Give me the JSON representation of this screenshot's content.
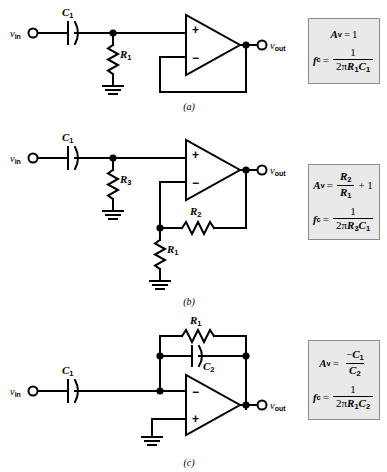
{
  "figure": {
    "type": "circuit-schematic-set",
    "background": "#ffffff",
    "ink_color": "#000000",
    "box_fill": "#e9e9e9",
    "box_border": "#8a8a8a"
  },
  "circuits": [
    {
      "id": "a",
      "caption": "(a)",
      "name": "unity-gain-high-pass-filter",
      "input_label": "v",
      "input_sub": "in",
      "output_label": "v",
      "output_sub": "out",
      "components": [
        {
          "ref": "C",
          "sub": "1",
          "kind": "capacitor",
          "orientation": "horizontal"
        },
        {
          "ref": "R",
          "sub": "1",
          "kind": "resistor",
          "orientation": "vertical"
        }
      ],
      "opamp": {
        "plus": "+",
        "minus": "−",
        "plus_position": "top",
        "minus_position": "bottom"
      },
      "formula": {
        "gain": {
          "lhs_main": "A",
          "lhs_sub": "v",
          "eq": "=",
          "rhs": "1"
        },
        "cutoff": {
          "lhs_main": "f",
          "lhs_sub": "c",
          "eq": "=",
          "numerator": "1",
          "denominator_prefix": "2π",
          "denominator_terms": [
            {
              "main": "R",
              "sub": "1"
            },
            {
              "main": "C",
              "sub": "1"
            }
          ]
        }
      }
    },
    {
      "id": "b",
      "caption": "(b)",
      "name": "non-inverting-gain-high-pass-filter",
      "input_label": "v",
      "input_sub": "in",
      "output_label": "v",
      "output_sub": "out",
      "components": [
        {
          "ref": "C",
          "sub": "1",
          "kind": "capacitor",
          "orientation": "horizontal"
        },
        {
          "ref": "R",
          "sub": "3",
          "kind": "resistor",
          "orientation": "vertical"
        },
        {
          "ref": "R",
          "sub": "2",
          "kind": "resistor",
          "orientation": "horizontal"
        },
        {
          "ref": "R",
          "sub": "1",
          "kind": "resistor",
          "orientation": "vertical"
        }
      ],
      "opamp": {
        "plus": "+",
        "minus": "−",
        "plus_position": "top",
        "minus_position": "bottom"
      },
      "formula": {
        "gain": {
          "lhs_main": "A",
          "lhs_sub": "v",
          "eq": "=",
          "numerator_main": "R",
          "numerator_sub": "2",
          "denominator_main": "R",
          "denominator_sub": "1",
          "trailing": "+ 1"
        },
        "cutoff": {
          "lhs_main": "f",
          "lhs_sub": "c",
          "eq": "=",
          "numerator": "1",
          "denominator_prefix": "2π",
          "denominator_terms": [
            {
              "main": "R",
              "sub": "3"
            },
            {
              "main": "C",
              "sub": "1"
            }
          ]
        }
      }
    },
    {
      "id": "c",
      "caption": "(c)",
      "name": "inverting-low-pass-filter",
      "input_label": "v",
      "input_sub": "in",
      "output_label": "v",
      "output_sub": "out",
      "components": [
        {
          "ref": "C",
          "sub": "1",
          "kind": "capacitor",
          "orientation": "horizontal"
        },
        {
          "ref": "R",
          "sub": "1",
          "kind": "resistor",
          "orientation": "horizontal"
        },
        {
          "ref": "C",
          "sub": "2",
          "kind": "capacitor",
          "orientation": "horizontal"
        }
      ],
      "opamp": {
        "plus": "+",
        "minus": "−",
        "plus_position": "bottom",
        "minus_position": "top"
      },
      "formula": {
        "gain": {
          "lhs_main": "A",
          "lhs_sub": "v",
          "eq": "=",
          "numerator_sign": "−",
          "numerator_main": "C",
          "numerator_sub": "1",
          "denominator_main": "C",
          "denominator_sub": "2"
        },
        "cutoff": {
          "lhs_main": "f",
          "lhs_sub": "c",
          "eq": "=",
          "numerator": "1",
          "denominator_prefix": "2π",
          "denominator_terms": [
            {
              "main": "R",
              "sub": "1"
            },
            {
              "main": "C",
              "sub": "2"
            }
          ]
        }
      }
    }
  ]
}
